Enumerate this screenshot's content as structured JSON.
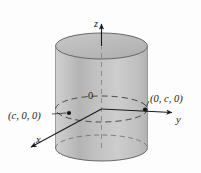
{
  "figure": {
    "domain": "diagram",
    "background_color": "#fdfdfd",
    "stroke_color": "#1a1a1a",
    "cylinder": {
      "fill_light": "#d8d8d8",
      "fill_mid": "#b9b9b9",
      "fill_dark": "#a8a8a8",
      "top_fill": "#c4c4c4",
      "outline_color": "#4a4a4a",
      "center_x": 101.5,
      "radius_x": 46,
      "radius_y": 13,
      "top_y": 46,
      "bottom_y": 148
    },
    "axes": [
      {
        "name": "z",
        "label": "z",
        "label_x": 94,
        "label_y": 27,
        "direction": "up"
      },
      {
        "name": "y",
        "label": "y",
        "label_x": 176,
        "label_y": 123,
        "direction": "right"
      },
      {
        "name": "x",
        "label": "x",
        "label_x": 36,
        "label_y": 143,
        "direction": "lower-left"
      }
    ],
    "origin": {
      "label": "0",
      "label_x": 88,
      "label_y": 99,
      "x": 101.5,
      "y": 109
    },
    "points": [
      {
        "name": "point-c-0-0",
        "label": "(c, 0, 0)",
        "label_x": 8,
        "label_y": 119,
        "marker_x": 69,
        "marker_y": 113
      },
      {
        "name": "point-0-c-0",
        "label": "(0, c, 0)",
        "label_x": 150,
        "label_y": 102,
        "marker_x": 145,
        "marker_y": 109
      }
    ],
    "ellipses": [
      {
        "name": "cylinder-top-rim",
        "style": "solid"
      },
      {
        "name": "xy-plane-circle",
        "style": "dashed"
      },
      {
        "name": "cylinder-bottom-rim",
        "style": "mixed"
      }
    ]
  }
}
